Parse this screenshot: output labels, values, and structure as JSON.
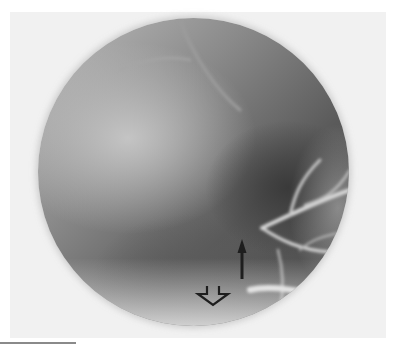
{
  "image": {
    "subject": "circular radiographic (X-ray) field view",
    "background_color": "#ffffff",
    "frame_color": "#f1f1f1",
    "annotations": [
      {
        "type": "solid-arrow",
        "direction": "up",
        "color": "#1e1e1e",
        "x": 242,
        "y_tip": 239,
        "y_tail": 279
      },
      {
        "type": "hollow-arrow",
        "direction": "down",
        "color": "#1e1e1e",
        "x": 212,
        "y": 295
      }
    ]
  }
}
